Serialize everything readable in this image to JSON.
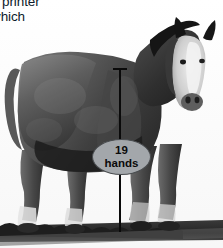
{
  "page": {
    "width": 223,
    "height": 248,
    "background": "#ffffff"
  },
  "body_text": {
    "line1": "r printer",
    "line2": "vhich",
    "color": "#0d1b2a"
  },
  "watermark": {
    "text": "mural artise",
    "color": "#f1f4f7"
  },
  "photo": {
    "subject": "draft horse standing in profile facing viewer",
    "style": "black and white photograph",
    "sky_color": "#fbfbfb",
    "body_dark": "#3b3b3b",
    "body_mid": "#6f6f6f",
    "body_light": "#9a9a9a",
    "ground_color": "#2b2b2b"
  },
  "measurement": {
    "line_color": "#0a0a0a",
    "cap_label": "withers height marker"
  },
  "callout": {
    "value": "19",
    "unit": "hands",
    "fill": "#a3a7ab",
    "stroke": "#4a4d50",
    "text_color": "#0a0a0a"
  }
}
